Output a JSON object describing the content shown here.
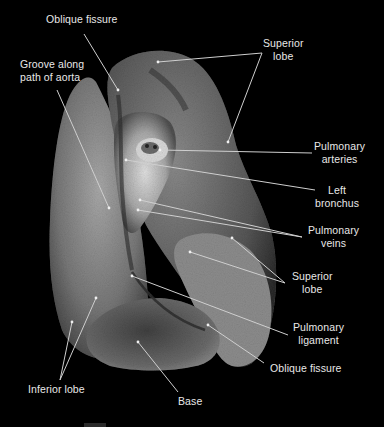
{
  "figure": {
    "background": "#000000",
    "label_color": "#e8e8e8",
    "leader_color": "#c8c8c8"
  },
  "labels": [
    {
      "id": "oblique-fissure-top",
      "text": "Oblique fissure"
    },
    {
      "id": "groove-aorta",
      "text": "Groove along\npath of aorta"
    },
    {
      "id": "superior-lobe-top",
      "text": "Superior\nlobe"
    },
    {
      "id": "pulmonary-arteries",
      "text": "Pulmonary\narteries"
    },
    {
      "id": "left-bronchus",
      "text": "Left\nbronchus"
    },
    {
      "id": "pulmonary-veins",
      "text": "Pulmonary\nveins"
    },
    {
      "id": "superior-lobe-bottom",
      "text": "Superior\nlobe"
    },
    {
      "id": "pulmonary-ligament",
      "text": "Pulmonary\nligament"
    },
    {
      "id": "oblique-fissure-bottom",
      "text": "Oblique fissure"
    },
    {
      "id": "inferior-lobe",
      "text": "Inferior lobe"
    },
    {
      "id": "base",
      "text": "Base"
    }
  ]
}
